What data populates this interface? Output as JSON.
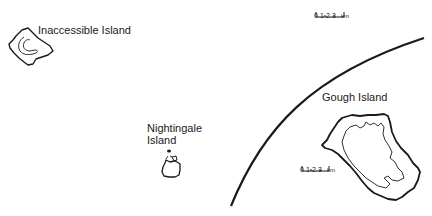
{
  "map": {
    "islands": [
      {
        "name": "Inaccessible Island",
        "label": "Inaccessible Island"
      },
      {
        "name": "Nightingale Island",
        "label_line1": "Nightingale",
        "label_line2": "Island"
      },
      {
        "name": "Gough Island",
        "label": "Gough Island"
      }
    ],
    "scale_bars": [
      {
        "ticks": [
          "0",
          "1",
          "2",
          "3"
        ],
        "unit": "km",
        "position": "top"
      },
      {
        "ticks": [
          "0",
          "1",
          "2",
          "3"
        ],
        "unit": "km",
        "position": "gough"
      }
    ],
    "colors": {
      "ink": "#1a1a1a",
      "background": "#ffffff"
    }
  }
}
